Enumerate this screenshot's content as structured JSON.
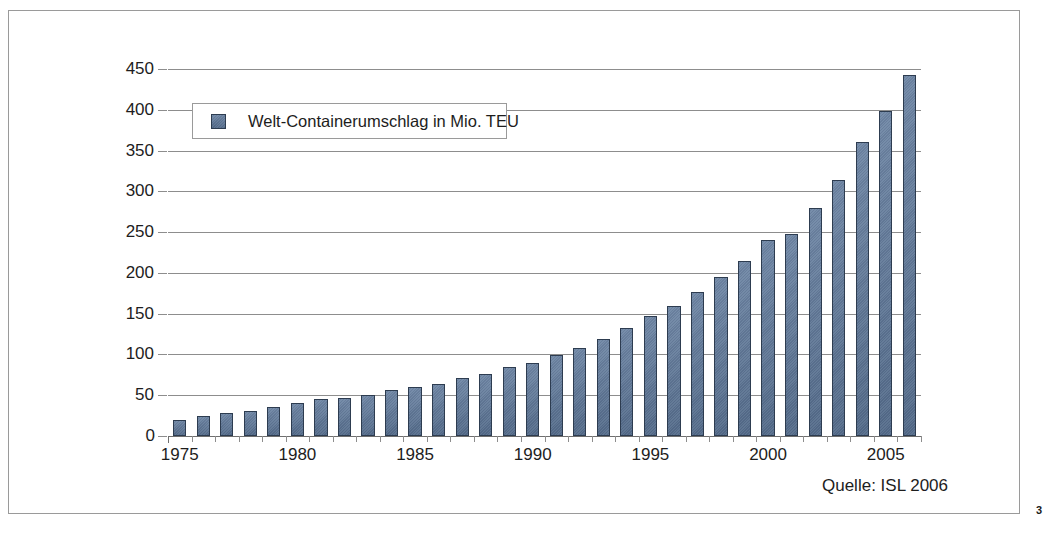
{
  "page": {
    "page_number": "3",
    "source_note": "Quelle: ISL 2006"
  },
  "legend": {
    "entries": [
      {
        "label": "Welt-Containerumschlag in Mio. TEU",
        "color": "#5e789b"
      }
    ]
  },
  "colors": {
    "bar_fill": "#5e789b",
    "bar_edge": "#2d3c50",
    "gridline": "#8d8d8d",
    "frame_border": "#9a9a9a",
    "text": "#1d1d1d",
    "background": "#ffffff"
  },
  "chart_data": {
    "type": "bar",
    "title": "",
    "subtitle": "",
    "xlabel": "",
    "ylabel": "",
    "series": [
      {
        "name": "Welt-Containerumschlag in Mio. TEU",
        "color": "#5e789b",
        "values": [
          20,
          25,
          28,
          31,
          36,
          41,
          45,
          47,
          50,
          57,
          60,
          64,
          71,
          76,
          85,
          90,
          99,
          108,
          119,
          132,
          147,
          160,
          177,
          195,
          214,
          240,
          248,
          280,
          314,
          360,
          399,
          443
        ]
      }
    ],
    "categories": [
      "1975",
      "1976",
      "1977",
      "1978",
      "1979",
      "1980",
      "1981",
      "1982",
      "1983",
      "1984",
      "1985",
      "1986",
      "1987",
      "1988",
      "1989",
      "1990",
      "1991",
      "1992",
      "1993",
      "1994",
      "1995",
      "1996",
      "1997",
      "1998",
      "1999",
      "2000",
      "2001",
      "2002",
      "2003",
      "2004",
      "2005",
      "2006"
    ],
    "x_tick_labels": [
      "1975",
      "1980",
      "1985",
      "1990",
      "1995",
      "2000",
      "2005"
    ],
    "x_tick_categories": [
      "1975",
      "1980",
      "1985",
      "1990",
      "1995",
      "2000",
      "2005"
    ],
    "y_tick_labels": [
      "0",
      "50",
      "100",
      "150",
      "200",
      "250",
      "300",
      "350",
      "400",
      "450"
    ],
    "y_ticks": [
      0,
      50,
      100,
      150,
      200,
      250,
      300,
      350,
      400,
      450
    ],
    "ylim": [
      0,
      450
    ],
    "grid": true,
    "grid_axis": "y",
    "legend_position": "upper-left-inside",
    "annotations": [
      "Quelle: ISL 2006"
    ]
  }
}
